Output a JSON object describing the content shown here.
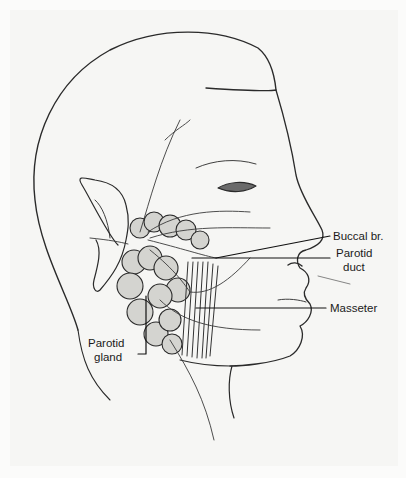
{
  "diagram": {
    "labels": {
      "buccal_branch": "Buccal br.",
      "parotid_duct_line1": "Parotid",
      "parotid_duct_line2": "duct",
      "masseter": "Masseter",
      "parotid_gland_line1": "Parotid",
      "parotid_gland_line2": "gland"
    },
    "colors": {
      "ink": "#2a2a2a",
      "paper": "#f6f6f4",
      "shade": "#c9c9c6"
    }
  }
}
